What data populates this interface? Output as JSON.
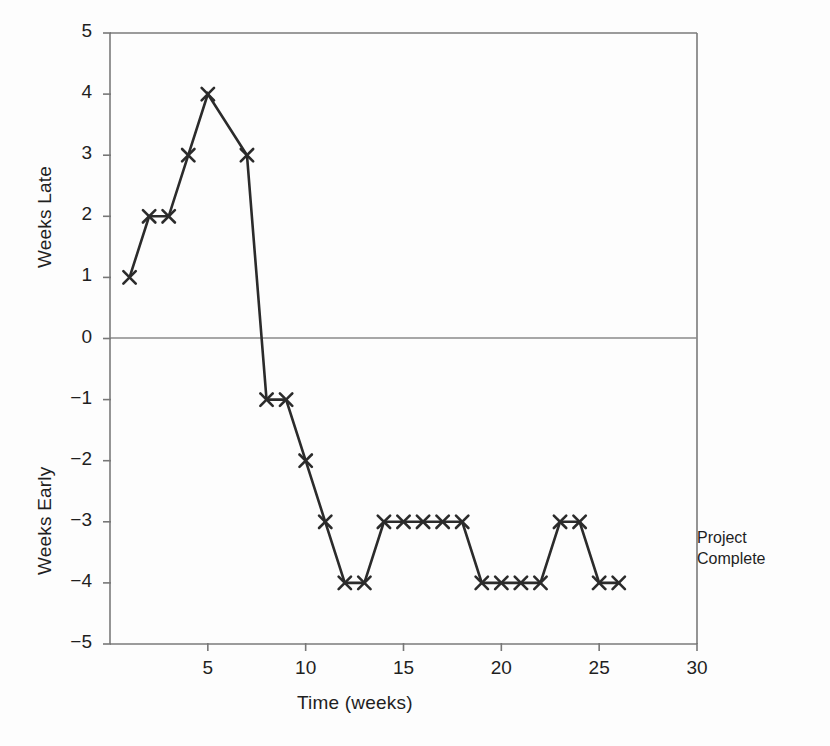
{
  "chart_data": {
    "type": "line",
    "title": "",
    "xlabel": "Time (weeks)",
    "ylabel_upper": "Weeks Late",
    "ylabel_lower": "Weeks Early",
    "xlim": [
      0,
      30
    ],
    "ylim": [
      -5,
      5
    ],
    "xticks": [
      5,
      10,
      15,
      20,
      25,
      30
    ],
    "xtick_labels": [
      "5",
      "10",
      "15",
      "20",
      "25",
      "30"
    ],
    "yticks": [
      5,
      4,
      3,
      2,
      1,
      0,
      -1,
      -2,
      -3,
      -4,
      -5
    ],
    "ytick_labels": [
      "5",
      "4",
      "3",
      "2",
      "1",
      "0",
      "−1",
      "−2",
      "−3",
      "−4",
      "−5"
    ],
    "grid": false,
    "zero_line": true,
    "legend": "none",
    "marker": "x",
    "line_color": "#2b2b2b",
    "axis_color": "#777777",
    "series": [
      {
        "name": "Schedule variance",
        "x": [
          1,
          2,
          3,
          4,
          5,
          7,
          8,
          9,
          10,
          11,
          12,
          13,
          14,
          15,
          16,
          17,
          18,
          19,
          20,
          21,
          22,
          23,
          24,
          25,
          26
        ],
        "values": [
          1,
          2,
          2,
          3,
          4,
          3,
          -1,
          -1,
          -2,
          -3,
          -4,
          -4,
          -3,
          -3,
          -3,
          -3,
          -3,
          -4,
          -4,
          -4,
          -4,
          -3,
          -3,
          -4,
          -4
        ]
      }
    ],
    "annotations": [
      {
        "name": "project-complete",
        "line1": "Project",
        "line2": "Complete",
        "x": 26.5,
        "y": -3.2
      }
    ]
  },
  "axis": {
    "x_title": "Time (weeks)",
    "y_title_upper": "Weeks Late",
    "y_title_lower": "Weeks Early"
  }
}
